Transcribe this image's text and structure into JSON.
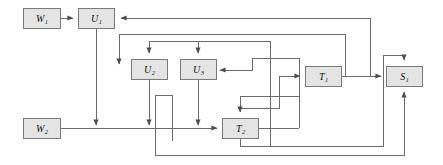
{
  "diagram": {
    "type": "block-flow-graph",
    "title": "",
    "canvas": {
      "width": 443,
      "height": 165
    },
    "style": {
      "node_fill": "#e4e4e4",
      "node_stroke": "#7a7a7a",
      "edge_stroke": "#6b6b6b",
      "background": "#ffffff"
    },
    "nodes": [
      {
        "id": "W1",
        "base": "W",
        "sub": "1",
        "x": 23,
        "y": 8,
        "w": 38,
        "h": 21
      },
      {
        "id": "U1",
        "base": "U",
        "sub": "1",
        "x": 78,
        "y": 8,
        "w": 37,
        "h": 21
      },
      {
        "id": "U2",
        "base": "U",
        "sub": "2",
        "x": 131,
        "y": 59,
        "w": 37,
        "h": 21
      },
      {
        "id": "U3",
        "base": "U",
        "sub": "3",
        "x": 180,
        "y": 59,
        "w": 37,
        "h": 21
      },
      {
        "id": "T1",
        "base": "T",
        "sub": "1",
        "x": 305,
        "y": 66,
        "w": 37,
        "h": 21
      },
      {
        "id": "S1",
        "base": "S",
        "sub": "1",
        "x": 386,
        "y": 66,
        "w": 37,
        "h": 21
      },
      {
        "id": "W2",
        "base": "W",
        "sub": "2",
        "x": 23,
        "y": 118,
        "w": 38,
        "h": 21
      },
      {
        "id": "T2",
        "base": "T",
        "sub": "2",
        "x": 222,
        "y": 118,
        "w": 37,
        "h": 21
      }
    ],
    "edges": [
      {
        "from": "W1",
        "to": "U1",
        "points": "61,18 74,18"
      },
      {
        "from": "U1",
        "to": "W2-line",
        "points": "96,29 96,128"
      },
      {
        "from": "S1-feedback",
        "to": "U1",
        "points": "370,18 119,18"
      },
      {
        "from": "loop-top",
        "to": "U2",
        "points": "119,34 119,66"
      },
      {
        "from": "top-bus",
        "to": "U2-top",
        "points": "119,34 345,34"
      },
      {
        "from": "top-bus2",
        "to": "U2-top-arrow",
        "points": "149,41 149,55"
      },
      {
        "from": "bus41",
        "to": "U3-top",
        "points": "128,41 270,41"
      },
      {
        "from": "u3-top",
        "to": "U3",
        "points": "198,41 198,55"
      },
      {
        "from": "u3-right-in",
        "to": "U3",
        "points": "252,70 221,70"
      },
      {
        "from": "u3-right-src",
        "to": "u3-right-in",
        "points": "252,58 252,70"
      },
      {
        "from": "u3-right-bus",
        "to": "u3-right-src",
        "points": "252,58 299,58"
      },
      {
        "from": "U2",
        "to": "W2-line",
        "points": "149,80 149,128"
      },
      {
        "from": "U2-jog",
        "to": "jog",
        "points": "155,95 172,95 172,138"
      },
      {
        "from": "U3",
        "to": "W2-line",
        "points": "198,80 198,128"
      },
      {
        "from": "W2",
        "to": "T2",
        "points": "61,128 218,128"
      },
      {
        "from": "T1",
        "to": "S1",
        "points": "342,76 382,76"
      },
      {
        "from": "T1-in",
        "to": "T1",
        "points": "279,76 301,76"
      },
      {
        "from": "T1-feed",
        "to": "T1-in",
        "points": "279,108 279,76"
      },
      {
        "from": "T1-feed-bus",
        "to": "T1-feed",
        "points": "238,108 279,108"
      },
      {
        "from": "T2-top",
        "to": "T2",
        "points": "240,96 240,114"
      },
      {
        "from": "T2-top-bus",
        "to": "T2-top",
        "points": "240,96 299,96"
      },
      {
        "from": "vert270",
        "to": "bottom",
        "points": "270,41 270,146"
      },
      {
        "from": "vert299",
        "to": "T2-top-bus",
        "points": "299,58 299,96"
      },
      {
        "from": "T2-right",
        "to": "up",
        "points": "259,128 299,128"
      },
      {
        "from": "T2-bottom-ret",
        "to": "S1-bottom",
        "points": "240,139 240,146 383,146 383,55 404,55 404,62"
      },
      {
        "from": "bottom-ret2",
        "to": "S1-bottom",
        "points": "155,138 155,155 404,155 404,90"
      },
      {
        "from": "S1-up-ret",
        "to": "U1-ret",
        "points": "370,76 370,18"
      },
      {
        "from": "T1-up-ret",
        "to": "top-bus",
        "points": "345,76 345,34"
      }
    ],
    "labels": {
      "W1": "W",
      "U1": "U",
      "U2": "U",
      "U3": "U",
      "T1": "T",
      "S1": "S",
      "W2": "W",
      "T2": "T"
    }
  }
}
